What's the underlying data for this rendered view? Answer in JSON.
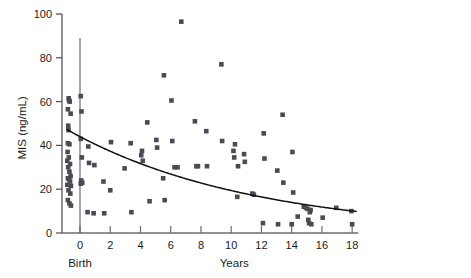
{
  "chart_data": {
    "type": "scatter",
    "title": "",
    "xlabel": "Years",
    "ylabel": "MIS (ng/mL)",
    "xlim": [
      -1.2,
      18.4
    ],
    "ylim": [
      0,
      100
    ],
    "grid": false,
    "legend": null,
    "x_ticks": [
      0,
      2,
      4,
      6,
      8,
      10,
      12,
      14,
      16,
      18
    ],
    "x_tick_labels": [
      "0",
      "2",
      "4",
      "6",
      "8",
      "10",
      "12",
      "14",
      "16",
      "18"
    ],
    "y_ticks": [
      0,
      20,
      40,
      60,
      80,
      100
    ],
    "y_tick_labels": [
      "0",
      "20",
      "40",
      "60",
      "80",
      "100"
    ],
    "annotations": [
      {
        "text": "Birth",
        "x": 0,
        "y": -14,
        "name": "birth-label"
      },
      {
        "text": "Years",
        "x": 10.2,
        "y": -14,
        "name": "years-axis-label"
      }
    ],
    "reference_line": {
      "type": "vertical",
      "x": 0,
      "y_from": 0,
      "y_to": 89
    },
    "series": [
      {
        "name": "MIS measurements",
        "marker": "square",
        "color": "#4b4b55",
        "points": [
          [
            -0.75,
            61.5
          ],
          [
            -0.72,
            60.5
          ],
          [
            -0.68,
            60.0
          ],
          [
            -0.8,
            56.5
          ],
          [
            -0.62,
            54.5
          ],
          [
            -0.78,
            49.0
          ],
          [
            -0.76,
            47.0
          ],
          [
            -0.8,
            41.0
          ],
          [
            -0.7,
            40.5
          ],
          [
            -0.82,
            37.0
          ],
          [
            -0.74,
            34.5
          ],
          [
            -0.84,
            33.0
          ],
          [
            -0.66,
            31.5
          ],
          [
            -0.78,
            30.0
          ],
          [
            -0.7,
            28.0
          ],
          [
            -0.62,
            26.0
          ],
          [
            -0.8,
            25.0
          ],
          [
            -0.72,
            24.5
          ],
          [
            -0.66,
            23.5
          ],
          [
            -0.84,
            22.0
          ],
          [
            -0.6,
            21.5
          ],
          [
            -0.76,
            19.5
          ],
          [
            -0.64,
            18.0
          ],
          [
            -0.8,
            15.0
          ],
          [
            -0.7,
            13.5
          ],
          [
            -0.6,
            12.5
          ],
          [
            0.05,
            62.5
          ],
          [
            0.1,
            55.5
          ],
          [
            0.05,
            43.0
          ],
          [
            0.12,
            34.5
          ],
          [
            0.08,
            24.0
          ],
          [
            0.15,
            23.0
          ],
          [
            0.05,
            22.5
          ],
          [
            0.55,
            39.5
          ],
          [
            0.6,
            32.0
          ],
          [
            0.5,
            9.5
          ],
          [
            0.95,
            31.0
          ],
          [
            0.9,
            9.0
          ],
          [
            1.55,
            23.5
          ],
          [
            1.6,
            9.0
          ],
          [
            2.05,
            41.5
          ],
          [
            2.0,
            19.5
          ],
          [
            2.95,
            29.5
          ],
          [
            3.35,
            41.0
          ],
          [
            3.4,
            9.5
          ],
          [
            4.05,
            35.5
          ],
          [
            4.1,
            37.5
          ],
          [
            4.15,
            33.0
          ],
          [
            4.45,
            50.5
          ],
          [
            4.6,
            14.5
          ],
          [
            5.05,
            42.5
          ],
          [
            5.1,
            39.0
          ],
          [
            5.55,
            72.0
          ],
          [
            5.5,
            25.0
          ],
          [
            5.6,
            15.0
          ],
          [
            6.05,
            60.5
          ],
          [
            6.1,
            42.0
          ],
          [
            6.25,
            30.0
          ],
          [
            6.45,
            30.0
          ],
          [
            6.7,
            96.5
          ],
          [
            7.6,
            51.0
          ],
          [
            7.7,
            30.5
          ],
          [
            7.8,
            30.5
          ],
          [
            8.35,
            46.5
          ],
          [
            8.4,
            30.5
          ],
          [
            9.35,
            77.0
          ],
          [
            9.4,
            42.0
          ],
          [
            10.15,
            37.5
          ],
          [
            10.25,
            40.5
          ],
          [
            10.2,
            34.5
          ],
          [
            10.45,
            30.5
          ],
          [
            10.4,
            16.5
          ],
          [
            10.85,
            36.0
          ],
          [
            10.9,
            32.5
          ],
          [
            11.4,
            18.0
          ],
          [
            11.5,
            17.5
          ],
          [
            12.15,
            45.5
          ],
          [
            12.2,
            34.0
          ],
          [
            12.1,
            4.5
          ],
          [
            13.05,
            28.5
          ],
          [
            13.1,
            4.0
          ],
          [
            13.4,
            54.0
          ],
          [
            13.45,
            23.0
          ],
          [
            14.05,
            37.0
          ],
          [
            14.1,
            18.5
          ],
          [
            14.0,
            4.0
          ],
          [
            14.4,
            7.5
          ],
          [
            14.8,
            12.0
          ],
          [
            14.95,
            11.5
          ],
          [
            15.05,
            11.0
          ],
          [
            15.1,
            6.0
          ],
          [
            15.2,
            9.5
          ],
          [
            15.25,
            10.5
          ],
          [
            15.15,
            4.5
          ],
          [
            15.3,
            4.0
          ],
          [
            16.05,
            7.0
          ],
          [
            16.95,
            11.5
          ],
          [
            17.95,
            10.0
          ],
          [
            18.0,
            4.0
          ]
        ]
      }
    ],
    "fit_curve": {
      "name": "exponential decay fit",
      "color": "#111111",
      "description": "MIS = 44.0 * exp(-0.082 * years)",
      "amplitude": 44.0,
      "rate": 0.082,
      "x_from": -0.9,
      "x_to": 18.3
    }
  }
}
